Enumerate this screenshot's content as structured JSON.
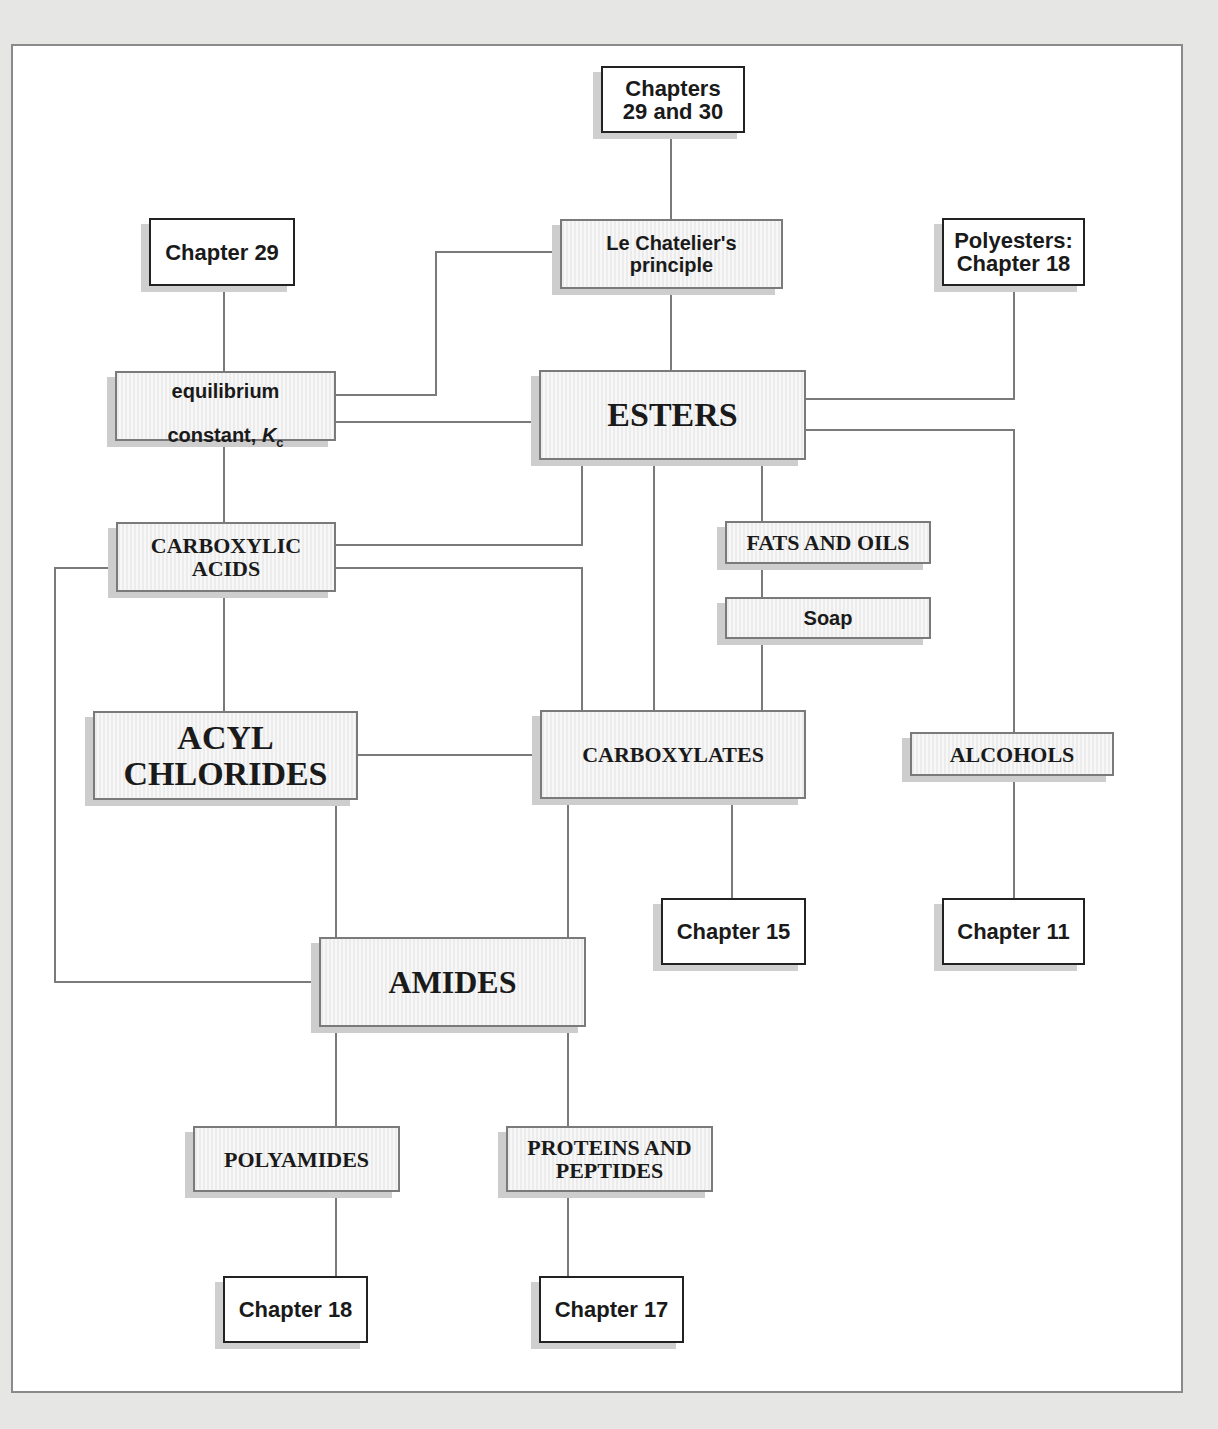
{
  "diagram": {
    "nodes": {
      "ch29_30": "Chapters\n29 and 30",
      "ch29": "Chapter 29",
      "lechatelier": "Le Chatelier's\nprinciple",
      "polyesters": "Polyesters:\nChapter 18",
      "equilibrium_line1": "equilibrium",
      "equilibrium_line2": "constant, ",
      "equilibrium_k": "K",
      "equilibrium_sub": "c",
      "esters": "ESTERS",
      "carboxylic": "CARBOXYLIC\nACIDS",
      "fats": "FATS AND OILS",
      "soap": "Soap",
      "acyl": "ACYL\nCHLORIDES",
      "carboxylates": "CARBOXYLATES",
      "alcohols": "ALCOHOLS",
      "ch15": "Chapter 15",
      "ch11": "Chapter 11",
      "amides": "AMIDES",
      "polyamides": "POLYAMIDES",
      "proteins": "PROTEINS AND\nPEPTIDES",
      "ch18": "Chapter 18",
      "ch17": "Chapter 17"
    },
    "colors": {
      "line": "#7a7a7a",
      "border": "#8a8a8a",
      "background": "#e6e6e4"
    }
  }
}
